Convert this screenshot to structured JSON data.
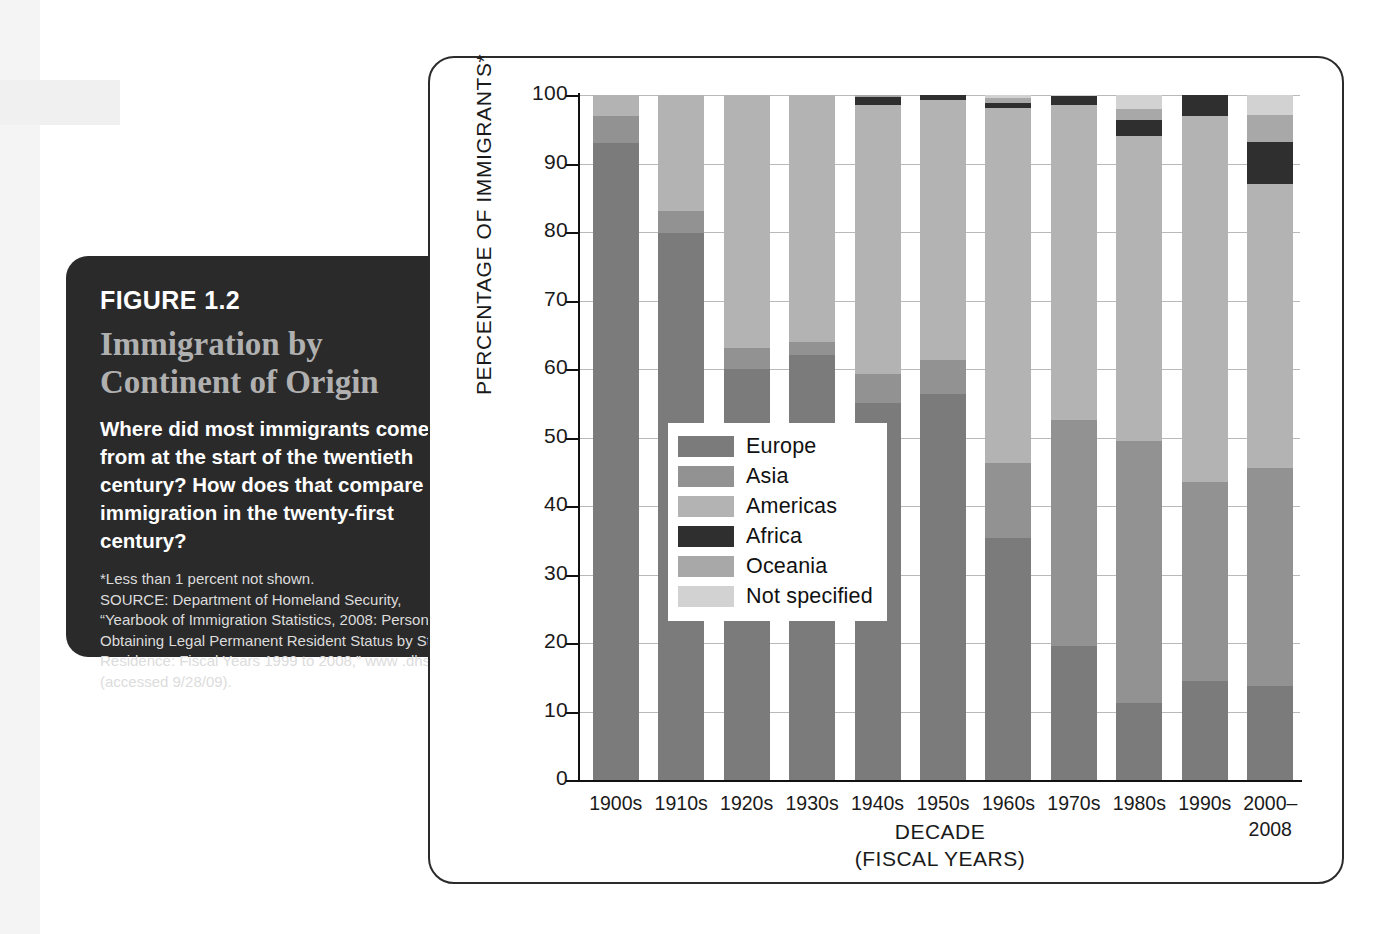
{
  "caption": {
    "figure_number": "FIGURE 1.2",
    "title": "Immigration by Continent of Origin",
    "question": "Where did most immigrants come from at the start of the twentieth century? How does that compare with immigration in the twenty-first century?",
    "footnote": "*Less than 1 percent not shown.",
    "source": "SOURCE: Department of Homeland Security, “Yearbook of Immigration Statistics, 2008: Persons Obtaining Legal Permanent Resident Status by State of Residence: Fiscal Years 1999 to 2008,” www .dhs.gov (accessed 9/28/09)."
  },
  "chart_data": {
    "type": "bar",
    "subtype": "stacked-100-percent",
    "title": "Immigration by Continent of Origin",
    "xlabel": "DECADE",
    "xlabel_sub": "(FISCAL YEARS)",
    "ylabel": "PERCENTAGE OF IMMIGRANTS*",
    "ylim": [
      0,
      100
    ],
    "yticks": [
      0,
      10,
      20,
      30,
      40,
      50,
      60,
      70,
      80,
      90,
      100
    ],
    "grid": true,
    "legend_position": "inside-center-left",
    "categories": [
      "1900s",
      "1910s",
      "1920s",
      "1930s",
      "1940s",
      "1950s",
      "1960s",
      "1970s",
      "1980s",
      "1990s",
      "2000–\n2008"
    ],
    "category_labels": [
      "1900s",
      "1910s",
      "1920s",
      "1930s",
      "1940s",
      "1950s",
      "1960s",
      "1970s",
      "1980s",
      "1990s",
      "2000– 2008"
    ],
    "series": [
      {
        "name": "Europe",
        "color": "#7b7b7b",
        "values": [
          93.0,
          79.9,
          60.0,
          62.0,
          55.0,
          56.3,
          35.3,
          19.5,
          11.2,
          14.5,
          13.7
        ]
      },
      {
        "name": "Asia",
        "color": "#929292",
        "values": [
          4.0,
          3.1,
          3.0,
          2.0,
          4.2,
          5.0,
          11.0,
          33.0,
          38.3,
          29.0,
          31.8
        ]
      },
      {
        "name": "Americas",
        "color": "#b3b3b3",
        "values": [
          3.0,
          17.0,
          37.0,
          36.0,
          39.3,
          38.0,
          51.8,
          46.0,
          44.5,
          53.5,
          41.5
        ]
      },
      {
        "name": "Africa",
        "color": "#2f2f2f",
        "values": [
          0.0,
          0.0,
          0.0,
          0.0,
          1.2,
          0.7,
          0.8,
          1.3,
          2.4,
          3.0,
          6.2
        ]
      },
      {
        "name": "Oceania",
        "color": "#a8a8a8",
        "values": [
          0.0,
          0.0,
          0.0,
          0.0,
          0.3,
          0.0,
          0.6,
          0.0,
          1.5,
          0.0,
          3.9
        ]
      },
      {
        "name": "Not specified",
        "color": "#d2d2d2",
        "values": [
          0.0,
          0.0,
          0.0,
          0.0,
          0.0,
          0.0,
          0.5,
          0.2,
          2.1,
          0.0,
          2.9
        ]
      }
    ],
    "legend": [
      {
        "label": "Europe",
        "color": "#7b7b7b"
      },
      {
        "label": "Asia",
        "color": "#929292"
      },
      {
        "label": "Americas",
        "color": "#b3b3b3"
      },
      {
        "label": "Africa",
        "color": "#2f2f2f"
      },
      {
        "label": "Oceania",
        "color": "#a8a8a8"
      },
      {
        "label": "Not specified",
        "color": "#d2d2d2"
      }
    ]
  }
}
